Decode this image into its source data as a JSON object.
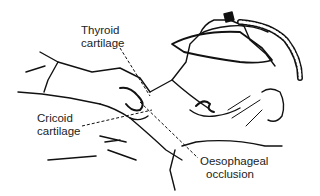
{
  "figure": {
    "labels": {
      "thyroid": [
        "Thyroid",
        "cartilage"
      ],
      "cricoid": [
        "Cricoid",
        "cartilage"
      ],
      "oesophageal": [
        "Oesophageal",
        "occlusion"
      ]
    },
    "line_color": "#111111",
    "background": "#ffffff"
  }
}
